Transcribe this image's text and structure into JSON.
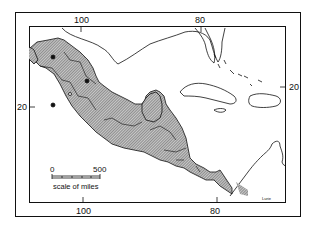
{
  "map": {
    "type": "region-distribution-map",
    "region": "Mexico, Central America and the Caribbean",
    "shaded_area": "Mexico and Central America through Panama into NW Colombia",
    "grid_labels": {
      "top": [
        "100",
        "80"
      ],
      "bottom": [
        "100",
        "80"
      ],
      "left": [
        "20"
      ],
      "right": [
        "20"
      ]
    },
    "scale_bar": {
      "start": "0",
      "end": "500",
      "caption": "scale of miles"
    },
    "signature": "Lurie",
    "colors": {
      "ink": "#111111",
      "hatch": "#9a9a9a",
      "paper": "#ffffff"
    }
  }
}
